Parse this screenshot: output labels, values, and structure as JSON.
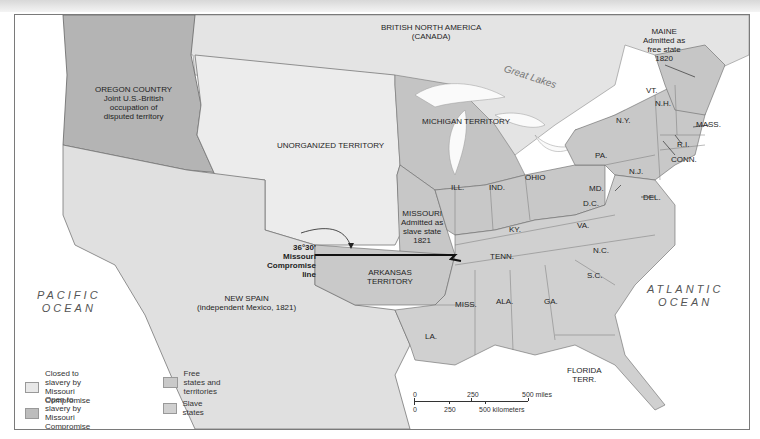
{
  "map": {
    "colors": {
      "closed": "#e8e8e8",
      "open": "#bdbdbd",
      "free": "#c9c9c9",
      "slave": "#d0d0d0",
      "oregon": "#b4b4b4",
      "foreign": "#e4e4e4",
      "water": "#ffffff",
      "compromise_line": "#111111"
    },
    "regions": {
      "british_north_america": "BRITISH NORTH AMERICA",
      "british_north_america_sub": "(CANADA)",
      "oregon": [
        "OREGON COUNTRY",
        "Joint U.S.-British",
        "occupation of",
        "disputed territory"
      ],
      "unorganized": "UNORGANIZED TERRITORY",
      "michigan": "MICHIGAN TERRITORY",
      "new_spain": "NEW SPAIN",
      "new_spain_sub": "(independent Mexico, 1821)",
      "missouri": [
        "MISSOURI",
        "Admitted as",
        "slave state",
        "1821"
      ],
      "arkansas": [
        "ARKANSAS",
        "TERRITORY"
      ],
      "maine": [
        "MAINE",
        "Admitted as",
        "free state",
        "1820"
      ],
      "florida": [
        "FLORIDA",
        "TERR."
      ]
    },
    "states": {
      "ill": "ILL.",
      "ind": "IND.",
      "ohio": "OHIO",
      "ky": "KY.",
      "tenn": "TENN.",
      "miss": "MISS.",
      "ala": "ALA.",
      "ga": "GA.",
      "la": "LA.",
      "sc": "S.C.",
      "nc": "N.C.",
      "va": "VA.",
      "dc": "D.C.",
      "md": "MD.",
      "del": "DEL.",
      "nj": "N.J.",
      "pa": "PA.",
      "ny": "N.Y.",
      "vt": "VT.",
      "nh": "N.H.",
      "mass": "MASS.",
      "ri": "R.I.",
      "conn": "CONN."
    },
    "water": {
      "great_lakes": "Great Lakes",
      "pacific": [
        "PACIFIC",
        "OCEAN"
      ],
      "atlantic": [
        "ATLANTIC",
        "OCEAN"
      ]
    },
    "compromise_label": [
      "36°30'",
      "Missouri",
      "Compromise",
      "line"
    ],
    "legend": [
      {
        "label": [
          "Closed to slavery by",
          "Missouri Compromise"
        ],
        "key": "closed"
      },
      {
        "label": [
          "Open to slavery by",
          "Missouri Compromise"
        ],
        "key": "open"
      },
      {
        "label": [
          "Free states and",
          "territories"
        ],
        "key": "free"
      },
      {
        "label": [
          "Slave states"
        ],
        "key": "slave"
      }
    ],
    "scale": {
      "miles": [
        "0",
        "250",
        "500 miles"
      ],
      "km": [
        "0",
        "250",
        "500 kilometers"
      ]
    }
  }
}
